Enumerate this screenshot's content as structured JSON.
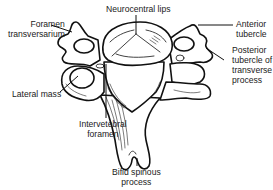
{
  "figure": {
    "labels": {
      "neurocentral_lips": "Neurocentral lips",
      "foramen_transversarium": [
        "Foramen",
        "transversarium"
      ],
      "anterior_tubercle": [
        "Anterior",
        "tubercle"
      ],
      "posterior_tubercle": [
        "Posterior",
        "tubercle of",
        "transverse",
        "process"
      ],
      "lateral_mass": "Lateral mass",
      "intervertebral_foramen": [
        "Intervetebral",
        "foramen"
      ],
      "bifid_spinous_process": [
        "Bifid spinous",
        "process"
      ]
    },
    "colors": {
      "line": "#111111",
      "background": "#ffffff",
      "text": "#1a1a1a"
    }
  }
}
